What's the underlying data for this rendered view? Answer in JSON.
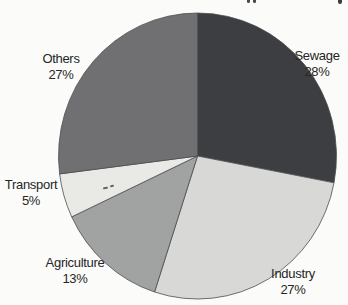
{
  "page": {
    "background_color": "#fbfbf9",
    "label_text_color": "#262626"
  },
  "chart_data": {
    "type": "pie",
    "start_angle_deg": 0,
    "direction": "clockwise",
    "outline_color": "#4c4c50",
    "legend_position": "none",
    "labels_placement": "outside",
    "categories": [
      "Sewage",
      "Industry",
      "Agriculture",
      "Transport",
      "Others"
    ],
    "values": [
      28,
      27,
      13,
      5,
      27
    ],
    "slices": [
      {
        "label": "Sewage",
        "pct": 28,
        "pct_label": "28%",
        "color": "#3d3e42"
      },
      {
        "label": "Industry",
        "pct": 27,
        "pct_label": "27%",
        "color": "#d8d8d6"
      },
      {
        "label": "Agriculture",
        "pct": 13,
        "pct_label": "13%",
        "color": "#a1a2a2"
      },
      {
        "label": "Transport",
        "pct": 5,
        "pct_label": "5%",
        "color": "#e9e9e5"
      },
      {
        "label": "Others",
        "pct": 27,
        "pct_label": "27%",
        "color": "#707073"
      }
    ]
  }
}
